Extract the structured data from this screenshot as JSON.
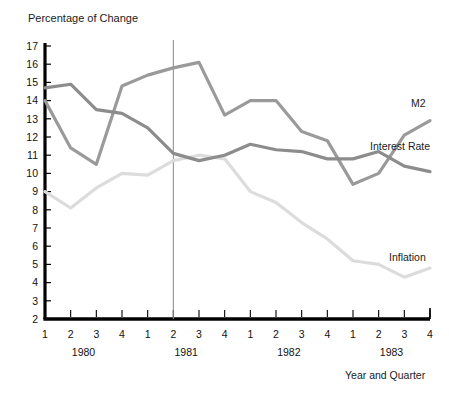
{
  "chart_data": {
    "type": "line",
    "title": "Percentage of Change",
    "xlabel": "Year and Quarter",
    "ylabel": "",
    "ylim": [
      2,
      17
    ],
    "xlim": [
      0,
      15
    ],
    "grid": false,
    "legend_position": "right-inline",
    "yticks": [
      17,
      16,
      15,
      14,
      13,
      12,
      11,
      10,
      9,
      8,
      7,
      6,
      5,
      4,
      3,
      2
    ],
    "x_quarter_labels": [
      "1",
      "2",
      "3",
      "4",
      "1",
      "2",
      "3",
      "4",
      "1",
      "2",
      "3",
      "4",
      "1",
      "2",
      "3",
      "4"
    ],
    "x_year_groups": [
      {
        "label": "1980",
        "start_index": 0,
        "end_index": 3
      },
      {
        "label": "1981",
        "start_index": 4,
        "end_index": 7
      },
      {
        "label": "1982",
        "start_index": 8,
        "end_index": 11
      },
      {
        "label": "1983",
        "start_index": 12,
        "end_index": 15
      }
    ],
    "categories": [
      "1980 Q1",
      "1980 Q2",
      "1980 Q3",
      "1980 Q4",
      "1981 Q1",
      "1981 Q2",
      "1981 Q3",
      "1981 Q4",
      "1982 Q1",
      "1982 Q2",
      "1982 Q3",
      "1982 Q4",
      "1983 Q1",
      "1983 Q2",
      "1983 Q3",
      "1983 Q4"
    ],
    "series": [
      {
        "name": "Interest Rate",
        "color": "#8c8c8c",
        "values": [
          14.7,
          14.9,
          13.5,
          13.3,
          12.5,
          11.1,
          10.7,
          11.0,
          11.6,
          11.3,
          11.2,
          10.8,
          10.8,
          11.2,
          10.4,
          10.1
        ]
      },
      {
        "name": "M2",
        "color": "#9a9a9a",
        "values": [
          14.0,
          11.4,
          10.5,
          14.8,
          15.4,
          15.8,
          16.1,
          13.2,
          14.0,
          14.0,
          12.3,
          11.8,
          9.4,
          10.0,
          12.1,
          12.9
        ]
      },
      {
        "name": "Inflation",
        "color": "#dcdcdc",
        "values": [
          9.0,
          8.1,
          9.2,
          10.0,
          9.9,
          10.7,
          11.0,
          10.8,
          9.0,
          8.4,
          7.3,
          6.4,
          5.2,
          5.0,
          4.3,
          4.8
        ]
      }
    ],
    "annotations": [
      {
        "type": "vertical-reference-line",
        "at_index": 5,
        "at_label": "1981 Q2",
        "color": "#888888"
      }
    ],
    "series_labels": [
      {
        "name": "M2",
        "x": 411,
        "y": 97
      },
      {
        "name": "Interest Rate",
        "x": 370,
        "y": 140
      },
      {
        "name": "Inflation",
        "x": 389,
        "y": 251
      }
    ]
  }
}
